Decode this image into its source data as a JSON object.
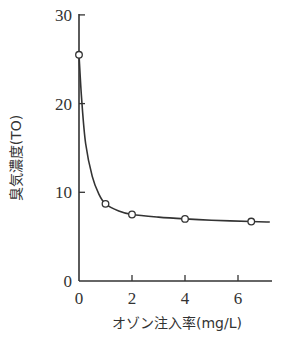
{
  "chart_data": {
    "type": "line",
    "title": "",
    "xlabel": "オゾン注入率(mg/L)",
    "ylabel": "臭気濃度(TO)",
    "xlim": [
      0,
      7.2
    ],
    "ylim": [
      0,
      30
    ],
    "xticks": [
      0,
      2,
      4,
      6
    ],
    "yticks": [
      0,
      10,
      20,
      30
    ],
    "grid": false,
    "legend": null,
    "series": [
      {
        "name": "measured",
        "marker": "open-circle",
        "x": [
          0,
          1,
          2,
          4,
          6.5
        ],
        "y": [
          25.5,
          8.7,
          7.5,
          7.0,
          6.7
        ]
      }
    ],
    "fitted_curve": {
      "x": [
        0,
        0.1,
        0.25,
        0.5,
        0.75,
        1,
        1.5,
        2,
        3,
        4,
        5,
        6.5,
        7.2
      ],
      "y": [
        25.5,
        20.5,
        15.5,
        11.8,
        9.8,
        8.7,
        7.9,
        7.5,
        7.2,
        7.0,
        6.85,
        6.7,
        6.65
      ]
    }
  },
  "axes": {
    "x_ticks": [
      "0",
      "2",
      "4",
      "6"
    ],
    "y_ticks": [
      "0",
      "10",
      "20",
      "30"
    ],
    "x_title": "オゾン注入率(mg/L)",
    "y_title": "臭気濃度(TO)"
  }
}
